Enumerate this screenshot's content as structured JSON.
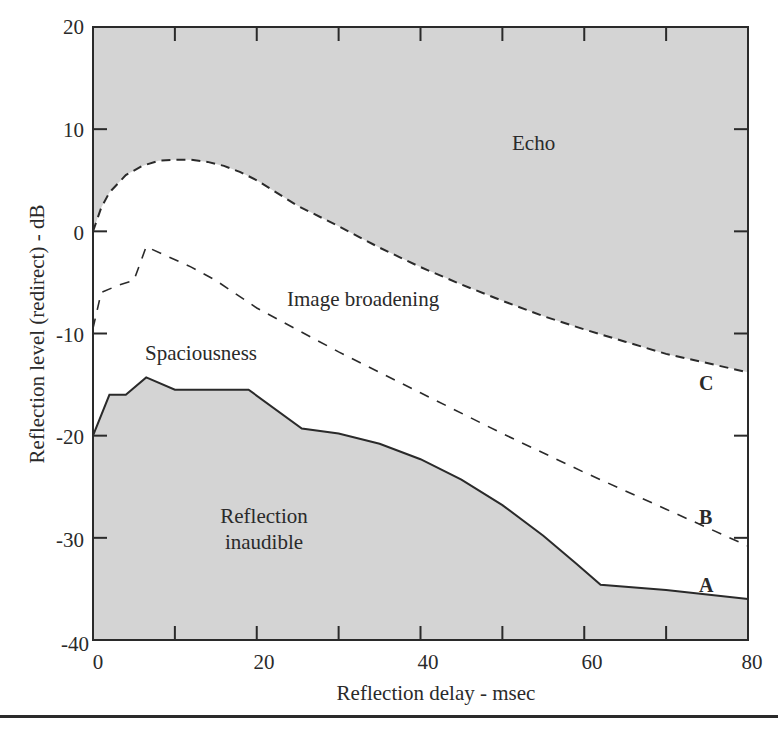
{
  "chart_data": {
    "type": "area",
    "title": "",
    "xlabel": "Reflection delay - msec",
    "ylabel": "Reflection level (redirect) - dB",
    "xlim": [
      0,
      80
    ],
    "ylim": [
      -40,
      20
    ],
    "x_ticks": [
      0,
      20,
      40,
      60,
      80
    ],
    "x_minor_ticks": [
      10,
      30,
      50,
      70
    ],
    "y_ticks": [
      20,
      10,
      0,
      -10,
      -20,
      -30,
      -40
    ],
    "grid": false,
    "legend": null,
    "series": [
      {
        "name": "C",
        "description": "Echo threshold (upper boundary, dashed)",
        "style": "dashed",
        "points": [
          [
            0,
            0
          ],
          [
            1,
            2.3
          ],
          [
            2,
            3.8
          ],
          [
            4,
            5.5
          ],
          [
            6,
            6.4
          ],
          [
            8,
            6.9
          ],
          [
            10,
            7.0
          ],
          [
            12,
            7.0
          ],
          [
            14,
            6.8
          ],
          [
            16,
            6.4
          ],
          [
            18,
            5.8
          ],
          [
            20,
            5.0
          ],
          [
            22,
            4.0
          ],
          [
            25,
            2.5
          ],
          [
            30,
            0.5
          ],
          [
            35,
            -1.6
          ],
          [
            40,
            -3.5
          ],
          [
            45,
            -5.2
          ],
          [
            50,
            -6.8
          ],
          [
            55,
            -8.3
          ],
          [
            60,
            -9.6
          ],
          [
            65,
            -10.8
          ],
          [
            70,
            -12.0
          ],
          [
            75,
            -12.9
          ],
          [
            80,
            -13.8
          ]
        ]
      },
      {
        "name": "B",
        "description": "Image broadening threshold (dashed)",
        "style": "dashed",
        "points": [
          [
            0,
            -9.5
          ],
          [
            1,
            -6
          ],
          [
            3,
            -5.3
          ],
          [
            5,
            -4.8
          ],
          [
            6.5,
            -1.5
          ],
          [
            12,
            -3.5
          ],
          [
            15,
            -4.8
          ],
          [
            20,
            -7.5
          ],
          [
            30,
            -11.8
          ],
          [
            40,
            -15.8
          ],
          [
            50,
            -19.8
          ],
          [
            60,
            -23.6
          ],
          [
            70,
            -27.2
          ],
          [
            80,
            -30.8
          ]
        ]
      },
      {
        "name": "A",
        "description": "Audibility threshold (solid, bounds 'Reflection inaudible')",
        "style": "solid",
        "points": [
          [
            0,
            -20
          ],
          [
            2,
            -16
          ],
          [
            4,
            -16
          ],
          [
            6.5,
            -14.3
          ],
          [
            10,
            -15.5
          ],
          [
            19,
            -15.5
          ],
          [
            25.5,
            -19.3
          ],
          [
            30,
            -19.8
          ],
          [
            35,
            -20.8
          ],
          [
            40,
            -22.3
          ],
          [
            45,
            -24.3
          ],
          [
            50,
            -26.8
          ],
          [
            55,
            -29.8
          ],
          [
            59,
            -32.5
          ],
          [
            62,
            -34.6
          ],
          [
            70,
            -35.1
          ],
          [
            80,
            -36
          ]
        ]
      }
    ],
    "regions": [
      {
        "name": "Echo",
        "fill": "above C",
        "color": "#d4d4d4"
      },
      {
        "name": "Image broadening",
        "fill": "between B and C",
        "color": "#ffffff"
      },
      {
        "name": "Spaciousness",
        "fill": "between A and B",
        "color": "#ffffff"
      },
      {
        "name": "Reflection inaudible",
        "fill": "below A",
        "color": "#d4d4d4"
      }
    ]
  },
  "labels": {
    "echo": "Echo",
    "image_broadening": "Image broadening",
    "spaciousness": "Spaciousness",
    "reflection_inaudible_line1": "Reflection",
    "reflection_inaudible_line2": "inaudible",
    "curve_a": "A",
    "curve_b": "B",
    "curve_c": "C"
  },
  "colors": {
    "shaded": "#d4d4d4",
    "line": "#2a2a2a",
    "background": "#ffffff"
  }
}
